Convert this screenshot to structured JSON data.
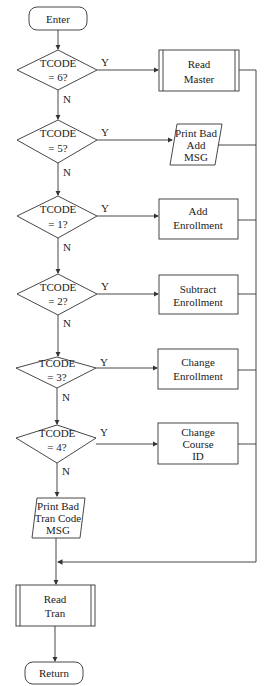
{
  "diagram": {
    "type": "flowchart",
    "start": {
      "label": "Enter"
    },
    "end": {
      "label": "Return"
    },
    "decisions": [
      {
        "line1": "TCODE",
        "line2": "=  6?",
        "yes_label": "Y",
        "no_label": "N",
        "yes_action": [
          "Read",
          "Master"
        ],
        "yes_shape": "predefined-process"
      },
      {
        "line1": "TCODE",
        "line2": "= 5?",
        "yes_label": "Y",
        "no_label": "N",
        "yes_action": [
          "Print Bad",
          "Add",
          "MSG"
        ],
        "yes_shape": "io"
      },
      {
        "line1": "TCODE",
        "line2": "= 1?",
        "yes_label": "Y",
        "no_label": "N",
        "yes_action": [
          "Add",
          "Enrollment"
        ],
        "yes_shape": "process"
      },
      {
        "line1": "TCODE",
        "line2": "= 2?",
        "yes_label": "Y",
        "no_label": "N",
        "yes_action": [
          "Subtract",
          "Enrollment"
        ],
        "yes_shape": "process"
      },
      {
        "line1": "TCODE",
        "line2": "= 3?",
        "yes_label": "Y",
        "no_label": "N",
        "yes_action": [
          "Change",
          "Enrollment"
        ],
        "yes_shape": "process"
      },
      {
        "line1": "TCODE",
        "line2": "= 4?",
        "yes_label": "Y",
        "no_label": "N",
        "yes_action": [
          "Change",
          "Course",
          "ID"
        ],
        "yes_shape": "process"
      }
    ],
    "default_action": {
      "lines": [
        "Print Bad",
        "Tran Code",
        "MSG"
      ],
      "shape": "io"
    },
    "after_merge": {
      "lines": [
        "Read",
        "Tran"
      ],
      "shape": "predefined-process"
    }
  }
}
